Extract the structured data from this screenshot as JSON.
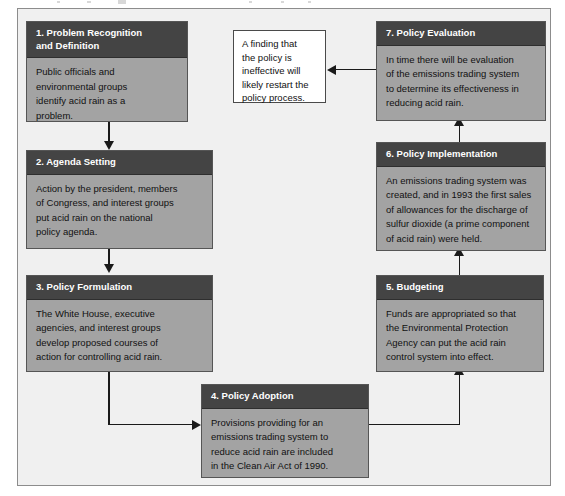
{
  "diagram": {
    "type": "policy-process-flowchart",
    "colors": {
      "frame_background": "#f0f0f0",
      "frame_border": "#8c8c8c",
      "node_header": "#444444",
      "node_body": "#a3a3a3",
      "node_border": "#555555",
      "header_text": "#ffffff",
      "body_text": "#111111",
      "connector": "#1a1a1a",
      "callout_background": "#ffffff",
      "callout_border": "#4a4a4a"
    },
    "nodes": [
      {
        "id": "step-1",
        "title": "1. Problem Recognition\n    and Definition",
        "body": "Public officials and\nenvironmental groups\nidentify acid rain as a\nproblem."
      },
      {
        "id": "step-2",
        "title": "2. Agenda Setting",
        "body": "Action by the president, members\nof Congress, and interest groups\nput acid rain on the national\npolicy agenda."
      },
      {
        "id": "step-3",
        "title": "3. Policy Formulation",
        "body": "The White House, executive\nagencies, and interest groups\ndevelop proposed courses of\naction for controlling acid rain."
      },
      {
        "id": "step-4",
        "title": "4. Policy Adoption",
        "body": "Provisions providing for an\nemissions trading system to\nreduce acid rain are included\nin the Clean Air Act of 1990."
      },
      {
        "id": "step-5",
        "title": "5. Budgeting",
        "body": "Funds are appropriated so that\nthe Environmental Protection\nAgency can put the acid rain\ncontrol system into effect."
      },
      {
        "id": "step-6",
        "title": "6. Policy Implementation",
        "body": "An emissions trading system was\ncreated, and in 1993 the first sales\nof allowances for the discharge of\nsulfur dioxide (a prime component\nof acid rain) were held."
      },
      {
        "id": "step-7",
        "title": "7. Policy Evaluation",
        "body": "In time there will be evaluation\nof the emissions trading system\nto determine its effectiveness in\nreducing acid rain."
      }
    ],
    "callout": {
      "id": "feedback-note",
      "text": "A finding that\nthe policy is\nineffective will\nlikely restart the\npolicy process."
    },
    "flow": [
      {
        "from": "step-1",
        "to": "step-2",
        "direction": "down"
      },
      {
        "from": "step-2",
        "to": "step-3",
        "direction": "down"
      },
      {
        "from": "step-3",
        "to": "step-4",
        "direction": "down-then-right"
      },
      {
        "from": "step-4",
        "to": "step-5",
        "direction": "right-then-up"
      },
      {
        "from": "step-5",
        "to": "step-6",
        "direction": "up"
      },
      {
        "from": "step-6",
        "to": "step-7",
        "direction": "up"
      },
      {
        "from": "step-7",
        "to": "feedback-note",
        "direction": "left"
      }
    ]
  }
}
